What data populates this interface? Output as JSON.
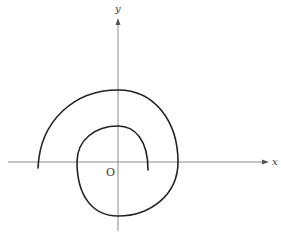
{
  "diagram": {
    "type": "spiral-curve-on-axes",
    "axes": {
      "x_label": "x",
      "y_label": "y",
      "origin_label": "O"
    },
    "colors": {
      "axis": "#8a8a8a",
      "curve": "#222222",
      "label": "#333333"
    },
    "curve": {
      "description": "Spiral curve winding around origin, starting left on the outer arc and ending inside near the positive x-axis",
      "path": "M38,168 C40,120 75,90 118,90 C155,90 178,122 178,162 C178,195 150,216 118,216 C92,216 77,195 77,162 C77,140 95,126 118,126 C135,126 148,140 148,170"
    }
  }
}
